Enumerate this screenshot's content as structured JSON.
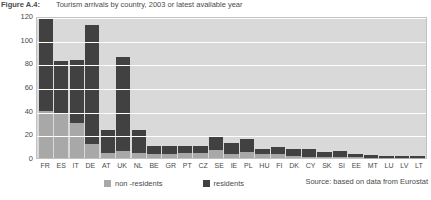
{
  "figure": {
    "label": "Figure A.4:",
    "title": "Tourism arrivals by country, 2003 or latest available year",
    "source": "Source: based on data from Eurostat"
  },
  "legend": {
    "items": [
      {
        "label": "non -residents",
        "color": "#a8a8a8",
        "swatch_name": "non-residents-swatch"
      },
      {
        "label": "residents",
        "color": "#414141",
        "swatch_name": "residents-swatch"
      }
    ]
  },
  "axes": {
    "y_label": "number",
    "y_ticks": [
      "120",
      "100",
      "80",
      "60",
      "40",
      "20",
      "0"
    ]
  },
  "chart_data": {
    "type": "bar",
    "subtype": "stacked-vertical",
    "title": "Tourism arrivals by country, 2003 or latest available year",
    "xlabel": "",
    "ylabel": "number",
    "ylim": [
      0,
      120
    ],
    "ytick_step": 20,
    "grid": true,
    "legend_position": "bottom-left",
    "categories": [
      "FR",
      "ES",
      "IT",
      "DE",
      "AT",
      "UK",
      "NL",
      "BE",
      "GR",
      "PT",
      "CZ",
      "SE",
      "IE",
      "PL",
      "HU",
      "FI",
      "DK",
      "CY",
      "SK",
      "SI",
      "EE",
      "MT",
      "LU",
      "LV",
      "LT"
    ],
    "series": [
      {
        "name": "non -residents",
        "color": "#a8a8a8",
        "values": [
          40,
          37,
          30,
          12,
          4,
          6,
          4,
          3,
          3,
          4,
          4,
          7,
          3,
          5,
          3,
          3,
          2,
          0.5,
          1,
          1,
          0.6,
          0.4,
          0.4,
          0.3,
          0.3
        ]
      },
      {
        "name": "residents",
        "color": "#414141",
        "values": [
          78,
          45,
          53,
          100,
          20,
          79,
          20,
          7,
          7,
          6,
          6,
          12,
          10,
          11,
          5,
          6,
          6,
          7,
          4,
          5,
          3,
          2,
          1.5,
          1,
          1
        ]
      }
    ],
    "totals": [
      118,
      82,
      83,
      112,
      24,
      85,
      24,
      10,
      10,
      10,
      10,
      19,
      13,
      16,
      8,
      9,
      8,
      7.5,
      5,
      6,
      3.6,
      2.4,
      1.9,
      1.3,
      1.3
    ]
  }
}
